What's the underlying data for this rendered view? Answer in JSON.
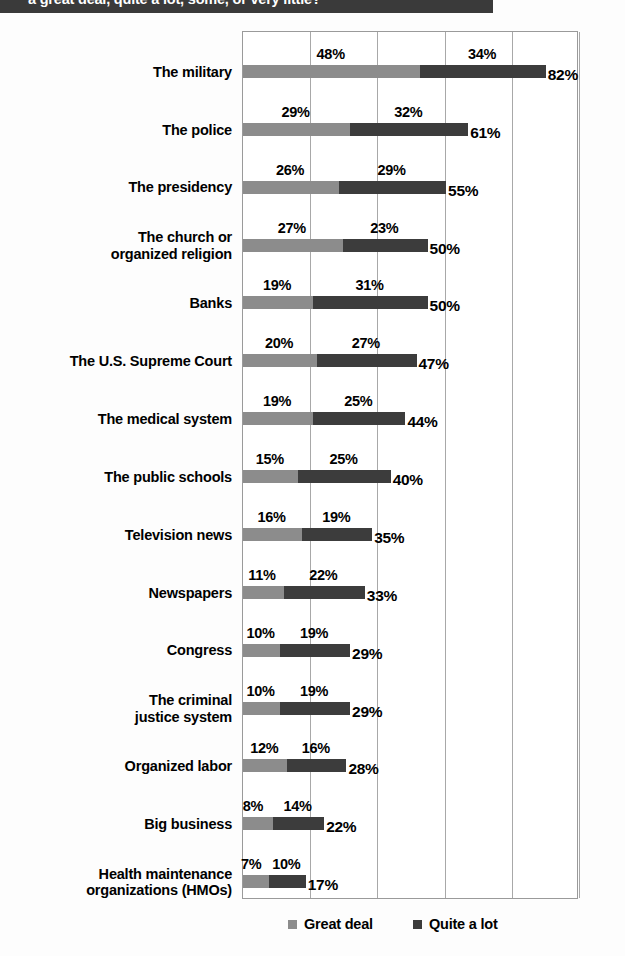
{
  "header": {
    "title": "a great deal, quite a lot, some, or very little?",
    "banner_color": "#3a3a3a"
  },
  "legend": {
    "items": [
      {
        "label": "Great deal",
        "color": "#8c8c8c",
        "swatch_name": "legend-swatch-great-deal"
      },
      {
        "label": "Quite a lot",
        "color": "#3c3c3c",
        "swatch_name": "legend-swatch-quite-a-lot"
      }
    ]
  },
  "chart_data": {
    "type": "bar",
    "subtype": "stacked-horizontal",
    "title": "a great deal, quite a lot, some, or very little?",
    "xlabel": "",
    "ylabel": "",
    "xlim": [
      0,
      91
    ],
    "grid": true,
    "gridline_values": [
      0,
      18.2,
      36.4,
      54.6,
      72.8,
      91
    ],
    "legend_position": "bottom",
    "categories": [
      "The military",
      "The police",
      "The presidency",
      "The church or organized religion",
      "Banks",
      "The U.S. Supreme Court",
      "The medical system",
      "The public schools",
      "Television news",
      "Newspapers",
      "Congress",
      "The criminal justice system",
      "Organized labor",
      "Big business",
      "Health maintenance organizations (HMOs)"
    ],
    "series": [
      {
        "name": "Great deal",
        "color": "#8c8c8c",
        "values": [
          48,
          29,
          26,
          27,
          19,
          20,
          19,
          15,
          16,
          11,
          10,
          10,
          12,
          8,
          7
        ]
      },
      {
        "name": "Quite a lot",
        "color": "#3c3c3c",
        "values": [
          34,
          32,
          29,
          23,
          31,
          27,
          25,
          25,
          19,
          22,
          19,
          19,
          16,
          14,
          10
        ]
      }
    ],
    "totals": [
      82,
      61,
      55,
      50,
      50,
      47,
      44,
      40,
      35,
      33,
      29,
      29,
      28,
      22,
      17
    ],
    "value_label_format": "{v}%",
    "rows": [
      {
        "category": "The military",
        "lines": [
          "The military"
        ],
        "great_deal": 48,
        "great_deal_label": "48%",
        "quite_a_lot": 34,
        "quite_a_lot_label": "34%",
        "total": 82,
        "total_label": "82%"
      },
      {
        "category": "The police",
        "lines": [
          "The police"
        ],
        "great_deal": 29,
        "great_deal_label": "29%",
        "quite_a_lot": 32,
        "quite_a_lot_label": "32%",
        "total": 61,
        "total_label": "61%"
      },
      {
        "category": "The presidency",
        "lines": [
          "The presidency"
        ],
        "great_deal": 26,
        "great_deal_label": "26%",
        "quite_a_lot": 29,
        "quite_a_lot_label": "29%",
        "total": 55,
        "total_label": "55%"
      },
      {
        "category": "The church or organized religion",
        "lines": [
          "The church or",
          "organized religion"
        ],
        "great_deal": 27,
        "great_deal_label": "27%",
        "quite_a_lot": 23,
        "quite_a_lot_label": "23%",
        "total": 50,
        "total_label": "50%"
      },
      {
        "category": "Banks",
        "lines": [
          "Banks"
        ],
        "great_deal": 19,
        "great_deal_label": "19%",
        "quite_a_lot": 31,
        "quite_a_lot_label": "31%",
        "total": 50,
        "total_label": "50%"
      },
      {
        "category": "The U.S. Supreme Court",
        "lines": [
          "The U.S. Supreme Court"
        ],
        "great_deal": 20,
        "great_deal_label": "20%",
        "quite_a_lot": 27,
        "quite_a_lot_label": "27%",
        "total": 47,
        "total_label": "47%"
      },
      {
        "category": "The medical system",
        "lines": [
          "The medical system"
        ],
        "great_deal": 19,
        "great_deal_label": "19%",
        "quite_a_lot": 25,
        "quite_a_lot_label": "25%",
        "total": 44,
        "total_label": "44%"
      },
      {
        "category": "The public schools",
        "lines": [
          "The public schools"
        ],
        "great_deal": 15,
        "great_deal_label": "15%",
        "quite_a_lot": 25,
        "quite_a_lot_label": "25%",
        "total": 40,
        "total_label": "40%"
      },
      {
        "category": "Television news",
        "lines": [
          "Television news"
        ],
        "great_deal": 16,
        "great_deal_label": "16%",
        "quite_a_lot": 19,
        "quite_a_lot_label": "19%",
        "total": 35,
        "total_label": "35%"
      },
      {
        "category": "Newspapers",
        "lines": [
          "Newspapers"
        ],
        "great_deal": 11,
        "great_deal_label": "11%",
        "quite_a_lot": 22,
        "quite_a_lot_label": "22%",
        "total": 33,
        "total_label": "33%"
      },
      {
        "category": "Congress",
        "lines": [
          "Congress"
        ],
        "great_deal": 10,
        "great_deal_label": "10%",
        "quite_a_lot": 19,
        "quite_a_lot_label": "19%",
        "total": 29,
        "total_label": "29%"
      },
      {
        "category": "The criminal justice system",
        "lines": [
          "The criminal",
          "justice system"
        ],
        "great_deal": 10,
        "great_deal_label": "10%",
        "quite_a_lot": 19,
        "quite_a_lot_label": "19%",
        "total": 29,
        "total_label": "29%"
      },
      {
        "category": "Organized labor",
        "lines": [
          "Organized labor"
        ],
        "great_deal": 12,
        "great_deal_label": "12%",
        "quite_a_lot": 16,
        "quite_a_lot_label": "16%",
        "total": 28,
        "total_label": "28%"
      },
      {
        "category": "Big business",
        "lines": [
          "Big business"
        ],
        "great_deal": 8,
        "great_deal_label": "8%",
        "quite_a_lot": 14,
        "quite_a_lot_label": "14%",
        "total": 22,
        "total_label": "22%"
      },
      {
        "category": "Health maintenance organizations (HMOs)",
        "lines": [
          "Health maintenance",
          "organizations (HMOs)"
        ],
        "great_deal": 7,
        "great_deal_label": "7%",
        "quite_a_lot": 10,
        "quite_a_lot_label": "10%",
        "total": 17,
        "total_label": "17%"
      }
    ]
  }
}
